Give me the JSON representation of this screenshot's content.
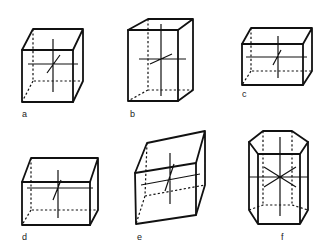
{
  "figure": {
    "panels": [
      {
        "id": "a",
        "label": "a"
      },
      {
        "id": "b",
        "label": "b"
      },
      {
        "id": "c",
        "label": "c"
      },
      {
        "id": "d",
        "label": "d"
      },
      {
        "id": "e",
        "label": "e"
      },
      {
        "id": "f",
        "label": "f"
      }
    ],
    "line_color": "#111111",
    "background": "#ffffff"
  }
}
